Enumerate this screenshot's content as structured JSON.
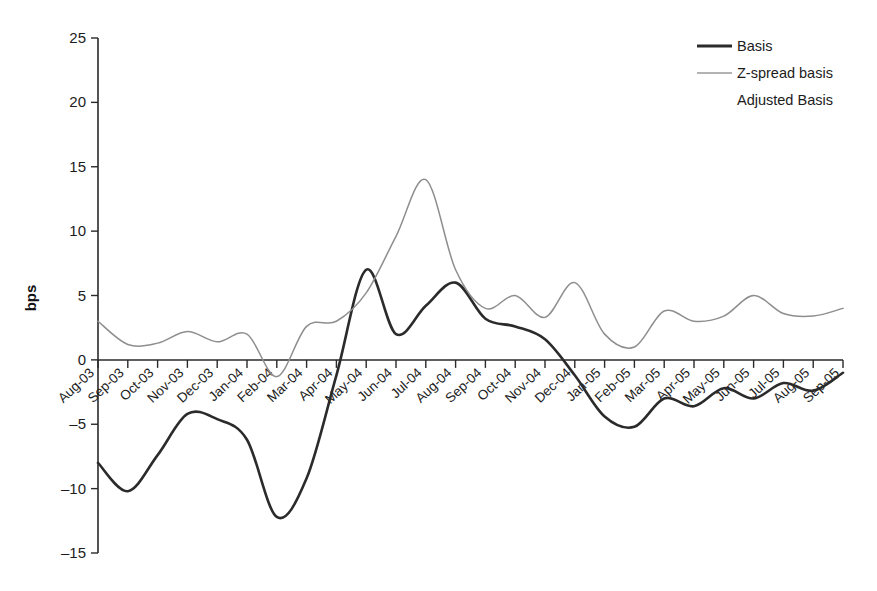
{
  "chart_data": {
    "type": "line",
    "title": "",
    "xlabel": "",
    "ylabel": "bps",
    "ylim": [
      -15,
      25
    ],
    "yticks": [
      25,
      20,
      15,
      10,
      5,
      0,
      -5,
      -10,
      -15
    ],
    "grid": false,
    "legend_position": "top-right",
    "categories": [
      "Aug-03",
      "Sep-03",
      "Oct-03",
      "Nov-03",
      "Dec-03",
      "Jan-04",
      "Feb-04",
      "Mar-04",
      "Apr-04",
      "May-04",
      "Jun-04",
      "Jul-04",
      "Aug-04",
      "Sep-04",
      "Oct-04",
      "Nov-04",
      "Dec-04",
      "Jan-05",
      "Feb-05",
      "Mar-05",
      "Apr-05",
      "May-05",
      "Jun-05",
      "Jul-05",
      "Aug-05",
      "Sep-05"
    ],
    "series": [
      {
        "name": "Basis",
        "color": "#2b2b2b",
        "values": [
          -8.0,
          -10.2,
          -7.4,
          -4.2,
          -4.6,
          -6.2,
          -12.2,
          -9.2,
          -1.2,
          7.0,
          2.0,
          4.2,
          6.0,
          3.2,
          2.6,
          1.6,
          -1.2,
          -4.4,
          -5.2,
          -3.0,
          -3.6,
          -2.2,
          -3.0,
          -1.8,
          -2.4,
          -1.0
        ]
      },
      {
        "name": "Z-spread basis",
        "color": "#8e8e8e",
        "values": [
          3.0,
          1.2,
          1.3,
          2.2,
          1.4,
          2.0,
          -1.3,
          2.6,
          3.0,
          5.2,
          9.6,
          14.0,
          7.0,
          4.0,
          5.0,
          3.3,
          6.0,
          2.0,
          1.0,
          3.8,
          3.0,
          3.4,
          5.0,
          3.6,
          3.4,
          4.0
        ]
      }
    ],
    "legend_entries": [
      {
        "label": "Basis",
        "has_swatch": true,
        "swatch_style": "thick-dark"
      },
      {
        "label": "Z-spread basis",
        "has_swatch": true,
        "swatch_style": "thin-grey"
      },
      {
        "label": "Adjusted Basis",
        "has_swatch": false,
        "swatch_style": "none"
      }
    ]
  }
}
